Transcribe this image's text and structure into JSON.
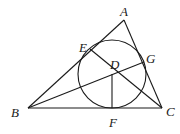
{
  "diagram": {
    "type": "geometry",
    "points": {
      "A": {
        "label": "A",
        "x": 124,
        "y": 20
      },
      "B": {
        "label": "B",
        "x": 28,
        "y": 108
      },
      "C": {
        "label": "C",
        "x": 162,
        "y": 108
      },
      "D": {
        "label": "D",
        "x": 112,
        "y": 74
      },
      "E": {
        "label": "E",
        "x": 90,
        "y": 49
      },
      "F": {
        "label": "F",
        "x": 112,
        "y": 108
      },
      "G": {
        "label": "G",
        "x": 144,
        "y": 62
      }
    },
    "circle": {
      "center": "D",
      "cx": 112,
      "cy": 74,
      "r": 34
    },
    "segments": [
      [
        "A",
        "B"
      ],
      [
        "B",
        "C"
      ],
      [
        "C",
        "A"
      ],
      [
        "B",
        "G"
      ],
      [
        "C",
        "E"
      ],
      [
        "D",
        "F"
      ]
    ],
    "label_positions": {
      "A": {
        "x": 120,
        "y": 16
      },
      "B": {
        "x": 11,
        "y": 117
      },
      "C": {
        "x": 166,
        "y": 116
      },
      "D": {
        "x": 110,
        "y": 69
      },
      "E": {
        "x": 79,
        "y": 52
      },
      "F": {
        "x": 109,
        "y": 127
      },
      "G": {
        "x": 146,
        "y": 63
      }
    },
    "colors": {
      "stroke": "#1a1a1a",
      "background": "#ffffff"
    }
  }
}
